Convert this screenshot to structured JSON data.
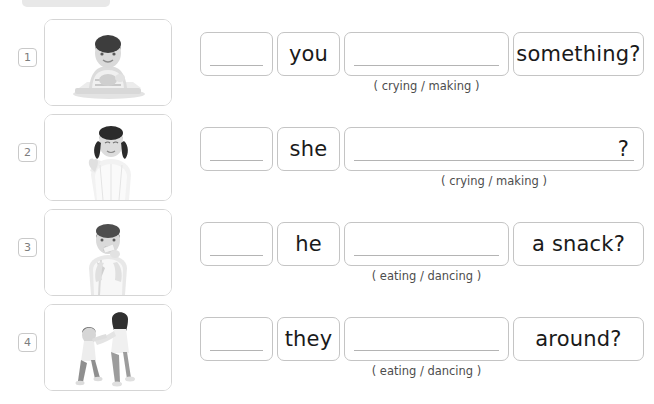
{
  "page": {
    "banner_color": "#e8e8e8",
    "border_color": "#c4c4c4"
  },
  "rows": [
    {
      "number": "1",
      "image_name": "photo-boy-at-table",
      "image_alt": "boy sitting at a table",
      "blank_box": "",
      "pronoun": "you",
      "verb_blank": "",
      "hint": "( crying / making )",
      "phrase": "something?",
      "layout": "four-box"
    },
    {
      "number": "2",
      "image_name": "photo-girl-crying",
      "image_alt": "girl with pigtails wiping her eye",
      "blank_box": "",
      "pronoun": "she",
      "verb_blank": "?",
      "hint": "( crying / making )",
      "phrase": "",
      "layout": "wide-box"
    },
    {
      "number": "3",
      "image_name": "photo-boy-eating",
      "image_alt": "boy eating a snack",
      "blank_box": "",
      "pronoun": "he",
      "verb_blank": "",
      "hint": "( eating / dancing )",
      "phrase": "a snack?",
      "layout": "four-box"
    },
    {
      "number": "4",
      "image_name": "photo-children-dancing",
      "image_alt": "two children dancing",
      "blank_box": "",
      "pronoun": "they",
      "verb_blank": "",
      "hint": "( eating / dancing )",
      "phrase": "around?",
      "layout": "four-box"
    }
  ]
}
